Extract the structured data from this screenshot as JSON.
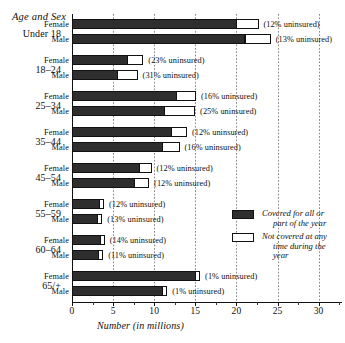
{
  "chart_data": {
    "type": "bar",
    "orientation": "horizontal",
    "stacked": true,
    "title": "",
    "xlabel": "Number (in millions)",
    "ylabel": "Age and Sex",
    "xlim": [
      0,
      38
    ],
    "xticks": [
      0,
      5,
      10,
      15,
      20,
      25,
      30,
      35
    ],
    "xticklabels": [
      "0",
      "5",
      "10",
      "15",
      "20",
      "25",
      "30",
      "35"
    ],
    "grid": true,
    "legend_position": "bottom-right",
    "series": [
      {
        "name": "Covered for all or part of the year",
        "color": "#2e2e2e"
      },
      {
        "name": "Not covered at any time during the year",
        "color": "#ffffff"
      }
    ],
    "groups": [
      {
        "age": "Under 18",
        "rows": [
          {
            "sex": "Female",
            "covered": 20.1,
            "uncovered": 2.7,
            "total": 22.8,
            "annotation": "(12% uninsured)"
          },
          {
            "sex": "Male",
            "covered": 21.1,
            "uncovered": 3.2,
            "total": 24.3,
            "annotation": "(13% uninsured)"
          }
        ]
      },
      {
        "age": "18–24",
        "rows": [
          {
            "sex": "Female",
            "covered": 6.8,
            "uncovered": 2.0,
            "total": 8.8,
            "annotation": "(23% uninsured)"
          },
          {
            "sex": "Male",
            "covered": 5.6,
            "uncovered": 2.5,
            "total": 8.1,
            "annotation": "(31% uninsured)"
          }
        ]
      },
      {
        "age": "25–34",
        "rows": [
          {
            "sex": "Female",
            "covered": 12.8,
            "uncovered": 2.4,
            "total": 15.2,
            "annotation": "(16% uninsured)"
          },
          {
            "sex": "Male",
            "covered": 11.3,
            "uncovered": 3.8,
            "total": 15.1,
            "annotation": "(25% uninsured)"
          }
        ]
      },
      {
        "age": "35–44",
        "rows": [
          {
            "sex": "Female",
            "covered": 12.2,
            "uncovered": 1.9,
            "total": 14.1,
            "annotation": "(12% uninsured)"
          },
          {
            "sex": "Male",
            "covered": 11.1,
            "uncovered": 2.1,
            "total": 13.2,
            "annotation": "(16% uninsured)"
          }
        ]
      },
      {
        "age": "45–54",
        "rows": [
          {
            "sex": "Female",
            "covered": 8.3,
            "uncovered": 1.5,
            "total": 9.8,
            "annotation": "(12% uninsured)"
          },
          {
            "sex": "Male",
            "covered": 7.7,
            "uncovered": 1.8,
            "total": 9.5,
            "annotation": "(12% uninsured)"
          }
        ]
      },
      {
        "age": "55–59",
        "rows": [
          {
            "sex": "Female",
            "covered": 3.4,
            "uncovered": 0.5,
            "total": 3.9,
            "annotation": "(12% uninsured)"
          },
          {
            "sex": "Male",
            "covered": 3.2,
            "uncovered": 0.5,
            "total": 3.7,
            "annotation": "(13% uninsured)"
          }
        ]
      },
      {
        "age": "60–64",
        "rows": [
          {
            "sex": "Female",
            "covered": 3.5,
            "uncovered": 0.6,
            "total": 4.1,
            "annotation": "(14% uninsured)"
          },
          {
            "sex": "Male",
            "covered": 3.3,
            "uncovered": 0.4,
            "total": 3.7,
            "annotation": "(11% uninsured)"
          }
        ]
      },
      {
        "age": "65/+",
        "rows": [
          {
            "sex": "Female",
            "covered": 15.1,
            "uncovered": 0.15,
            "total": 15.25,
            "annotation": "(1% uninsured)"
          },
          {
            "sex": "Male",
            "covered": 11.1,
            "uncovered": 0.11,
            "total": 11.21,
            "annotation": "(1% uninsured)"
          }
        ]
      }
    ]
  },
  "axis": {
    "y_header": "Age and Sex",
    "x_title": "Number (in millions)",
    "x_ticks": [
      "0",
      "5",
      "10",
      "15",
      "20",
      "25",
      "30",
      "35"
    ]
  },
  "legend": {
    "covered_line1": "Covered for all or",
    "covered_line2": "part of the year",
    "uncovered_line1": "Not covered at any",
    "uncovered_line2": "time during the year"
  },
  "colors": {
    "covered": "#2e2e2e",
    "uncovered": "#ffffff",
    "outline": "#111111",
    "grid": "#8a8a8a"
  }
}
